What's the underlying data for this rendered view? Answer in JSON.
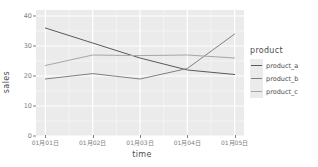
{
  "chart_data": {
    "type": "line",
    "title": "",
    "xlabel": "time",
    "ylabel": "sales",
    "categories": [
      "01月01日",
      "01月02日",
      "01月03日",
      "01月04日",
      "01月05日"
    ],
    "x_tick_labels": [
      "01月01日",
      "01月02日",
      "01月03日",
      "01月04日",
      "01月05日"
    ],
    "y_tick_labels": [
      "0",
      "10",
      "20",
      "30",
      "40"
    ],
    "y_ticks": [
      0,
      10,
      20,
      30,
      40
    ],
    "ylim": [
      0,
      42
    ],
    "grid": true,
    "legend_position": "right",
    "legend_title": "product",
    "series": [
      {
        "name": "product_a",
        "color": "#595959",
        "values": [
          36.0,
          31.0,
          26.0,
          22.0,
          20.5
        ]
      },
      {
        "name": "product_b",
        "color": "#808080",
        "values": [
          19.0,
          20.8,
          19.0,
          22.5,
          34.0
        ]
      },
      {
        "name": "product_c",
        "color": "#a6a6a6",
        "values": [
          23.5,
          27.0,
          26.8,
          27.0,
          26.0
        ]
      }
    ]
  },
  "theme": {
    "panel_background": "#ebebeb",
    "grid_major": "#ffffff",
    "grid_minor": "#f5f5f5",
    "page_background": "#ffffff",
    "axis_text": "#808080",
    "axis_title": "#4d4d4d"
  }
}
